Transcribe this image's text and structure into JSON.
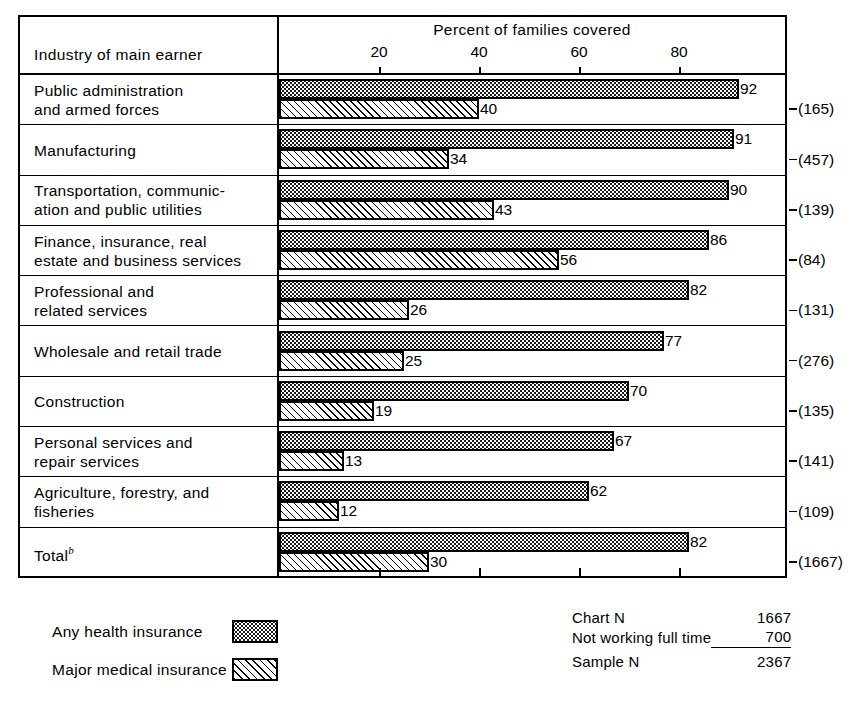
{
  "header": {
    "label_column_title": "Industry of main earner",
    "axis_title": "Percent of families covered"
  },
  "chart_data": {
    "type": "bar",
    "orientation": "horizontal",
    "title": "Percent of families covered",
    "xlabel": "Percent of families covered",
    "ylabel": "Industry of main earner",
    "xlim": [
      0,
      100
    ],
    "xticks": [
      20,
      40,
      60,
      80
    ],
    "grid": false,
    "legend_position": "bottom-left",
    "categories": [
      "Public administration and armed forces",
      "Manufacturing",
      "Transportation, communication and public utilities",
      "Finance, insurance, real estate and business services",
      "Professional and related services",
      "Wholesale and retail trade",
      "Construction",
      "Personal services and repair services",
      "Agriculture, forestry, and fisheries",
      "Total"
    ],
    "series": [
      {
        "name": "Any health insurance",
        "values": [
          92,
          91,
          90,
          86,
          82,
          77,
          70,
          67,
          62,
          82
        ]
      },
      {
        "name": "Major medical insurance",
        "values": [
          40,
          34,
          43,
          56,
          26,
          25,
          19,
          13,
          12,
          30
        ]
      }
    ],
    "sample_sizes": [
      165,
      457,
      139,
      84,
      131,
      276,
      135,
      141,
      109,
      1667
    ]
  },
  "rows": [
    {
      "label_line1": "Public administration",
      "label_line2": "and armed forces",
      "footnote": "",
      "any": 92,
      "major": 40,
      "n": "(165)"
    },
    {
      "label_line1": "Manufacturing",
      "label_line2": "",
      "footnote": "",
      "any": 91,
      "major": 34,
      "n": "(457)"
    },
    {
      "label_line1": "Transportation, communic-",
      "label_line2": "ation and public utilities",
      "footnote": "",
      "any": 90,
      "major": 43,
      "n": "(139)"
    },
    {
      "label_line1": "Finance, insurance, real",
      "label_line2": "estate and business services",
      "footnote": "",
      "any": 86,
      "major": 56,
      "n": "(84)"
    },
    {
      "label_line1": "Professional and",
      "label_line2": "related services",
      "footnote": "",
      "any": 82,
      "major": 26,
      "n": "(131)"
    },
    {
      "label_line1": "Wholesale and retail trade",
      "label_line2": "",
      "footnote": "",
      "any": 77,
      "major": 25,
      "n": "(276)"
    },
    {
      "label_line1": "Construction",
      "label_line2": "",
      "footnote": "",
      "any": 70,
      "major": 19,
      "n": "(135)"
    },
    {
      "label_line1": "Personal services and",
      "label_line2": "repair services",
      "footnote": "",
      "any": 67,
      "major": 13,
      "n": "(141)"
    },
    {
      "label_line1": "Agriculture, forestry, and",
      "label_line2": "fisheries",
      "footnote": "",
      "any": 62,
      "major": 12,
      "n": "(109)"
    },
    {
      "label_line1": "Total",
      "label_line2": "",
      "footnote": "b",
      "any": 82,
      "major": 30,
      "n": "(1667)"
    }
  ],
  "legend": [
    {
      "label": "Any health insurance",
      "pattern": "dotted"
    },
    {
      "label": "Major medical insurance",
      "pattern": "hatched"
    }
  ],
  "summary": {
    "chart_n_label": "Chart N",
    "chart_n_value": "1667",
    "not_working_label": "Not working full time",
    "not_working_value": "700",
    "sample_n_label": "Sample N",
    "sample_n_value": "2367"
  }
}
